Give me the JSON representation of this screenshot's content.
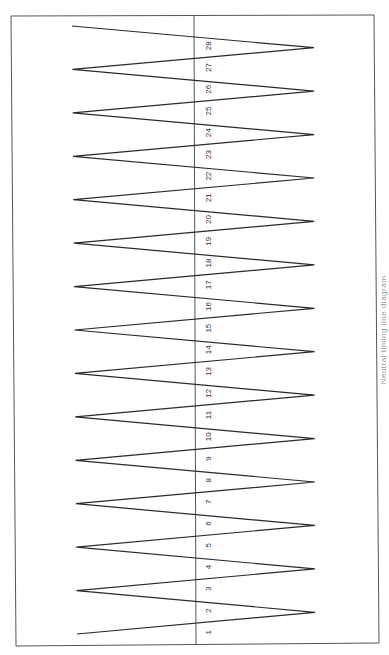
{
  "diagram": {
    "type": "zigzag-sequence",
    "orientation": "rotated-90",
    "frame": {
      "corners": [
        [
          11,
          16
        ],
        [
          374,
          15
        ],
        [
          379,
          643
        ],
        [
          16,
          646
        ]
      ],
      "stroke": "#555555"
    },
    "divider": {
      "x_top": 194,
      "x_bottom": 196,
      "stroke": "#555555"
    },
    "zigzag_stroke": "#2a2a2a",
    "labels": [
      "1",
      "2",
      "3",
      "4",
      "5",
      "6",
      "7",
      "8",
      "9",
      "10",
      "11",
      "12",
      "13",
      "14",
      "15",
      "16",
      "17",
      "18",
      "19",
      "20",
      "21",
      "22",
      "23",
      "24",
      "25",
      "26",
      "27",
      "28"
    ],
    "label_color": "#333333",
    "caption": "Neutral timing line diagram"
  }
}
